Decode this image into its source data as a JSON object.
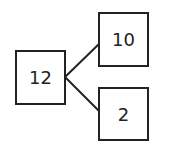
{
  "diagram": {
    "type": "number-bond",
    "colors": {
      "stroke": "#222222",
      "background": "#ffffff",
      "text": "#222222"
    },
    "nodes": {
      "whole": {
        "label": "12"
      },
      "part_top": {
        "label": "10"
      },
      "part_bottom": {
        "label": "2"
      }
    },
    "edges": [
      {
        "from": "whole",
        "to": "part_top"
      },
      {
        "from": "whole",
        "to": "part_bottom"
      }
    ]
  }
}
